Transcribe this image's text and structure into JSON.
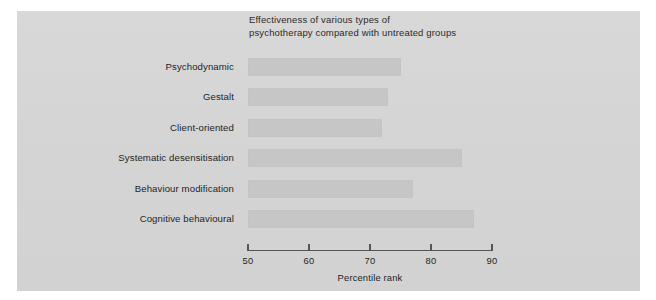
{
  "figure": {
    "background_color": "#ffffff",
    "panel_color": "#d6d6d6",
    "bar_color": "#c6c6c6",
    "axis_color": "#555555"
  },
  "chart_data": {
    "type": "bar",
    "orientation": "horizontal",
    "title": "Effectiveness of various types of\npsychotherapy compared with untreated groups",
    "xlabel": "Percentile rank",
    "ylabel": "",
    "categories": [
      "Psychodynamic",
      "Gestalt",
      "Client-oriented",
      "Systematic desensitisation",
      "Behaviour modification",
      "Cognitive behavioural"
    ],
    "values": [
      75,
      73,
      72,
      85,
      77,
      87
    ],
    "xlim": [
      50,
      90
    ],
    "xticks": [
      50,
      60,
      70,
      80,
      90
    ],
    "xticklabels": [
      "50",
      "60",
      "70",
      "80",
      "90"
    ],
    "grid": false,
    "legend": null
  }
}
